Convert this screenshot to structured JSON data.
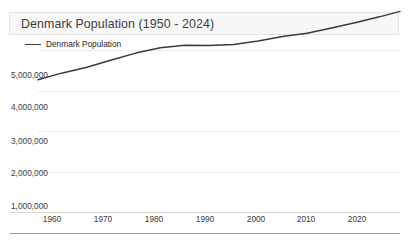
{
  "card": {
    "title": "Denmark Population (1950 - 2024)",
    "background": "#ffffff",
    "title_bar_background": "#f7f7f7",
    "title_bar_border": "#e3e3e3"
  },
  "legend": {
    "position": "top-left",
    "entries": [
      {
        "label": "Denmark Population",
        "color": "#3a3a3a"
      }
    ]
  },
  "axes": {
    "y_tick_labels": [
      "5,000,000",
      "4,000,000",
      "3,000,000",
      "2,000,000",
      "1,000,000"
    ],
    "x_tick_labels": [
      "1960",
      "1970",
      "1980",
      "1990",
      "2000",
      "2010",
      "2020"
    ]
  },
  "chart_data": {
    "type": "line",
    "title": "Denmark Population (1950 - 2024)",
    "xlabel": "",
    "ylabel": "",
    "grid": true,
    "legend_position": "top-left",
    "xlim": [
      1950,
      2024
    ],
    "ylim": [
      1000000,
      5500000
    ],
    "xticks": [
      1960,
      1970,
      1980,
      1990,
      2000,
      2010,
      2020
    ],
    "yticks": [
      1000000,
      2000000,
      3000000,
      4000000,
      5000000
    ],
    "series": [
      {
        "name": "Denmark Population",
        "color": "#3a3a3a",
        "x": [
          1950,
          1955,
          1960,
          1965,
          1970,
          1975,
          1980,
          1985,
          1990,
          1995,
          2000,
          2005,
          2010,
          2015,
          2020,
          2024
        ],
        "values": [
          4271000,
          4439000,
          4581000,
          4758000,
          4929000,
          5060000,
          5123000,
          5114000,
          5141000,
          5228000,
          5340000,
          5419000,
          5548000,
          5689000,
          5831000,
          5960000
        ]
      }
    ]
  }
}
